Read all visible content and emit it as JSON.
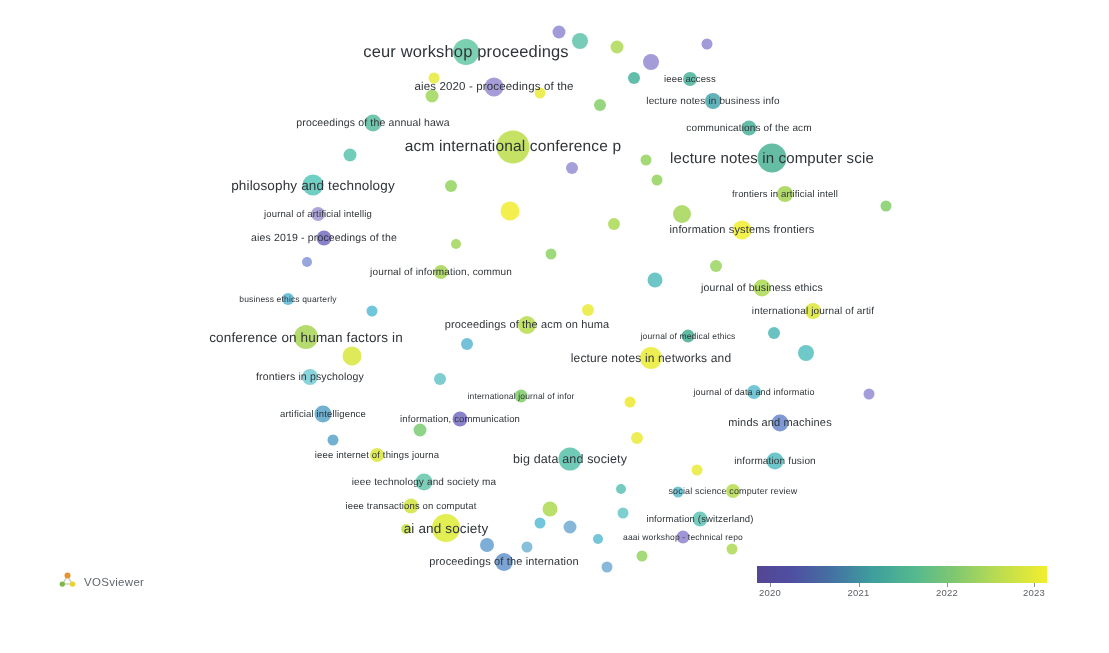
{
  "app": {
    "name": "VOSviewer",
    "brand_label": "VOSviewer",
    "logo_icon": "vosviewer-cluster-logo-icon",
    "background_color": "#ffffff"
  },
  "legend": {
    "title": "",
    "type": "continuous-color-overlay",
    "variable": "average publication year",
    "ticks": [
      {
        "label": "2020",
        "pos_pct": 4.5
      },
      {
        "label": "2021",
        "pos_pct": 35.0
      },
      {
        "label": "2022",
        "pos_pct": 65.5
      },
      {
        "label": "2023",
        "pos_pct": 95.5
      }
    ],
    "gradient_stops": [
      {
        "offset": 0,
        "color": "#4b3d8f"
      },
      {
        "offset": 12,
        "color": "#46469c"
      },
      {
        "offset": 26,
        "color": "#3a6b9e"
      },
      {
        "offset": 40,
        "color": "#349a98"
      },
      {
        "offset": 54,
        "color": "#4bb58a"
      },
      {
        "offset": 68,
        "color": "#79c569"
      },
      {
        "offset": 82,
        "color": "#b3d94a"
      },
      {
        "offset": 100,
        "color": "#f2ee22"
      }
    ]
  },
  "chart_data": {
    "type": "scatter",
    "title": "",
    "xlabel": "",
    "ylabel": "",
    "grid": false,
    "legend_position": "bottom-right",
    "color_scale": {
      "variable": "avg. pub. year",
      "min": 2020,
      "max": 2023,
      "colors": [
        "#4b3d8f",
        "#46469c",
        "#3a6b9e",
        "#349a98",
        "#4bb58a",
        "#79c569",
        "#b3d94a",
        "#f2ee22"
      ]
    },
    "labeled_nodes": [
      {
        "label": "ceur workshop proceedings",
        "x": 466,
        "y": 52,
        "size": 26,
        "font": 16.5,
        "color": "#5cc5a0",
        "year": 2021.5
      },
      {
        "label": "aies 2020 - proceedings of the",
        "x": 494,
        "y": 87,
        "size": 19,
        "font": 11.5,
        "color": "#8f84cf",
        "year": 2020.4
      },
      {
        "label": "ieee access",
        "x": 690,
        "y": 79,
        "size": 14,
        "font": 9.5,
        "color": "#3cad94",
        "year": 2021.2
      },
      {
        "label": "lecture notes in business info",
        "x": 713,
        "y": 101,
        "size": 16,
        "font": 10,
        "color": "#3b9fa8",
        "year": 2021.0
      },
      {
        "label": "proceedings of the annual hawa",
        "x": 373,
        "y": 123,
        "size": 17,
        "font": 10.5,
        "color": "#4fb89a",
        "year": 2021.3
      },
      {
        "label": "communications of the acm",
        "x": 749,
        "y": 128,
        "size": 15,
        "font": 10,
        "color": "#41ad93",
        "year": 2021.2
      },
      {
        "label": "acm international conference p",
        "x": 513,
        "y": 147,
        "size": 33,
        "font": 15.5,
        "color": "#b9dc3f",
        "year": 2022.6
      },
      {
        "label": "lecture notes in computer scie",
        "x": 772,
        "y": 158,
        "size": 29,
        "font": 15,
        "color": "#3fae8d",
        "year": 2021.6
      },
      {
        "label": "philosophy and technology",
        "x": 313,
        "y": 185,
        "size": 21,
        "font": 13.5,
        "color": "#4cc4b4",
        "year": 2021.1
      },
      {
        "label": "frontiers in artificial intell",
        "x": 785,
        "y": 194,
        "size": 16,
        "font": 9.5,
        "color": "#9fd247",
        "year": 2022.3
      },
      {
        "label": "journal of artificial intellig",
        "x": 318,
        "y": 214,
        "size": 14,
        "font": 9.5,
        "color": "#9a8fd0",
        "year": 2020.5
      },
      {
        "label": "information systems frontiers",
        "x": 742,
        "y": 230,
        "size": 19,
        "font": 11,
        "color": "#f2ee22",
        "year": 2022.9
      },
      {
        "label": "aies 2019 - proceedings of the",
        "x": 324,
        "y": 238,
        "size": 15,
        "font": 10.5,
        "color": "#6e63bd",
        "year": 2020.1
      },
      {
        "label": "journal of information, commun",
        "x": 441,
        "y": 272,
        "size": 14,
        "font": 10,
        "color": "#9fd24a",
        "year": 2022.2
      },
      {
        "label": "journal of business ethics",
        "x": 762,
        "y": 288,
        "size": 17,
        "font": 10.5,
        "color": "#a7d648",
        "year": 2022.2
      },
      {
        "label": "business ethics quarterly",
        "x": 288,
        "y": 299,
        "size": 12,
        "font": 8.5,
        "color": "#4fb4d4",
        "year": 2020.9
      },
      {
        "label": "international journal of artif",
        "x": 813,
        "y": 311,
        "size": 16,
        "font": 10,
        "color": "#dbe52c",
        "year": 2022.8
      },
      {
        "label": "proceedings of the acm on huma",
        "x": 527,
        "y": 325,
        "size": 18,
        "font": 11,
        "color": "#b2da42",
        "year": 2022.5
      },
      {
        "label": "conference on human factors in",
        "x": 306,
        "y": 337,
        "size": 24,
        "font": 13.5,
        "color": "#a3d34b",
        "year": 2022.1
      },
      {
        "label": "journal of medical ethics",
        "x": 688,
        "y": 336,
        "size": 13,
        "font": 8.5,
        "color": "#3ba98f",
        "year": 2021.3
      },
      {
        "label": "lecture notes in networks and",
        "x": 651,
        "y": 358,
        "size": 22,
        "font": 12,
        "color": "#e9ea26",
        "year": 2022.9
      },
      {
        "label": "frontiers in psychology",
        "x": 310,
        "y": 377,
        "size": 16,
        "font": 10.5,
        "color": "#6fc9d1",
        "year": 2021.0
      },
      {
        "label": "journal of data and informatio",
        "x": 754,
        "y": 392,
        "size": 14,
        "font": 9,
        "color": "#51b9cc",
        "year": 2021.1
      },
      {
        "label": "international journal of infor",
        "x": 521,
        "y": 396,
        "size": 13,
        "font": 8.5,
        "color": "#77c95f",
        "year": 2021.8
      },
      {
        "label": "artificial intelligence",
        "x": 323,
        "y": 414,
        "size": 17,
        "font": 9.5,
        "color": "#4f9ec4",
        "year": 2020.9
      },
      {
        "label": "information, communication",
        "x": 460,
        "y": 419,
        "size": 15,
        "font": 9.5,
        "color": "#6f63c0",
        "year": 2020.3
      },
      {
        "label": "minds and machines",
        "x": 780,
        "y": 423,
        "size": 17,
        "font": 11,
        "color": "#5f7fc9",
        "year": 2020.7
      },
      {
        "label": "ieee internet of things journa",
        "x": 377,
        "y": 455,
        "size": 14,
        "font": 9.5,
        "color": "#d9e52e",
        "year": 2022.8
      },
      {
        "label": "big data and society",
        "x": 570,
        "y": 459,
        "size": 23,
        "font": 12.5,
        "color": "#4dbfa5",
        "year": 2021.4
      },
      {
        "label": "information fusion",
        "x": 775,
        "y": 461,
        "size": 17,
        "font": 10,
        "color": "#49b8bc",
        "year": 2021.2
      },
      {
        "label": "ieee technology and society ma",
        "x": 424,
        "y": 482,
        "size": 17,
        "font": 10,
        "color": "#5cc3a8",
        "year": 2021.5
      },
      {
        "label": "social science computer review",
        "x": 733,
        "y": 491,
        "size": 14,
        "font": 9,
        "color": "#b2da40",
        "year": 2022.4
      },
      {
        "label": "ieee transactions on computat",
        "x": 411,
        "y": 506,
        "size": 15,
        "font": 9.5,
        "color": "#cfe233",
        "year": 2022.7
      },
      {
        "label": "information (switzerland)",
        "x": 700,
        "y": 519,
        "size": 15,
        "font": 9.5,
        "color": "#55c1b0",
        "year": 2021.3
      },
      {
        "label": "ai and society",
        "x": 446,
        "y": 528,
        "size": 28,
        "font": 13.5,
        "color": "#dcea28",
        "year": 2022.9
      },
      {
        "label": "aaai workshop - technical repo",
        "x": 683,
        "y": 537,
        "size": 13,
        "font": 8.5,
        "color": "#8a7ccb",
        "year": 2020.4
      },
      {
        "label": "proceedings of the internation",
        "x": 504,
        "y": 562,
        "size": 18,
        "font": 11,
        "color": "#5b8ecb",
        "year": 2020.8
      }
    ],
    "unlabeled_nodes": [
      {
        "x": 617,
        "y": 47,
        "size": 13,
        "color": "#a8d84a"
      },
      {
        "x": 580,
        "y": 41,
        "size": 16,
        "color": "#54c0a4"
      },
      {
        "x": 651,
        "y": 62,
        "size": 16,
        "color": "#8d84cf"
      },
      {
        "x": 559,
        "y": 32,
        "size": 13,
        "color": "#8a84d0"
      },
      {
        "x": 540,
        "y": 93,
        "size": 11,
        "color": "#e9ea2c"
      },
      {
        "x": 434,
        "y": 78,
        "size": 11,
        "color": "#e4e92c"
      },
      {
        "x": 600,
        "y": 105,
        "size": 12,
        "color": "#7ecb5e"
      },
      {
        "x": 432,
        "y": 96,
        "size": 13,
        "color": "#98d44f"
      },
      {
        "x": 634,
        "y": 78,
        "size": 12,
        "color": "#3caf95"
      },
      {
        "x": 350,
        "y": 155,
        "size": 13,
        "color": "#4fc0a9"
      },
      {
        "x": 572,
        "y": 168,
        "size": 12,
        "color": "#8f88d2"
      },
      {
        "x": 646,
        "y": 160,
        "size": 11,
        "color": "#8ed055"
      },
      {
        "x": 451,
        "y": 186,
        "size": 12,
        "color": "#8cd154"
      },
      {
        "x": 510,
        "y": 211,
        "size": 19,
        "color": "#f0ec24"
      },
      {
        "x": 614,
        "y": 224,
        "size": 12,
        "color": "#a6d84a"
      },
      {
        "x": 682,
        "y": 214,
        "size": 18,
        "color": "#9fd44c"
      },
      {
        "x": 307,
        "y": 262,
        "size": 10,
        "color": "#7f8fd4"
      },
      {
        "x": 551,
        "y": 254,
        "size": 11,
        "color": "#87d25d"
      },
      {
        "x": 655,
        "y": 280,
        "size": 15,
        "color": "#4bb8b8"
      },
      {
        "x": 716,
        "y": 266,
        "size": 12,
        "color": "#94d455"
      },
      {
        "x": 372,
        "y": 311,
        "size": 11,
        "color": "#4fb8d4"
      },
      {
        "x": 588,
        "y": 310,
        "size": 12,
        "color": "#e9ea2c"
      },
      {
        "x": 467,
        "y": 344,
        "size": 12,
        "color": "#52b4d2"
      },
      {
        "x": 806,
        "y": 353,
        "size": 16,
        "color": "#4cbcbc"
      },
      {
        "x": 352,
        "y": 356,
        "size": 19,
        "color": "#d6e630"
      },
      {
        "x": 440,
        "y": 379,
        "size": 12,
        "color": "#5ec1c4"
      },
      {
        "x": 774,
        "y": 333,
        "size": 12,
        "color": "#47b4b4"
      },
      {
        "x": 420,
        "y": 430,
        "size": 13,
        "color": "#72c96a"
      },
      {
        "x": 630,
        "y": 402,
        "size": 11,
        "color": "#ede824"
      },
      {
        "x": 869,
        "y": 394,
        "size": 11,
        "color": "#8d86d2"
      },
      {
        "x": 637,
        "y": 438,
        "size": 12,
        "color": "#e9e92c"
      },
      {
        "x": 550,
        "y": 509,
        "size": 15,
        "color": "#a7d845"
      },
      {
        "x": 487,
        "y": 545,
        "size": 14,
        "color": "#5d9acf"
      },
      {
        "x": 570,
        "y": 527,
        "size": 13,
        "color": "#68a6cf"
      },
      {
        "x": 540,
        "y": 523,
        "size": 11,
        "color": "#4fb8d4"
      },
      {
        "x": 623,
        "y": 513,
        "size": 11,
        "color": "#5fc4c4"
      },
      {
        "x": 607,
        "y": 567,
        "size": 11,
        "color": "#6ba8d2"
      },
      {
        "x": 678,
        "y": 492,
        "size": 11,
        "color": "#4fb8c9"
      },
      {
        "x": 697,
        "y": 470,
        "size": 11,
        "color": "#e9e92c"
      },
      {
        "x": 642,
        "y": 556,
        "size": 11,
        "color": "#8fd258"
      },
      {
        "x": 527,
        "y": 547,
        "size": 11,
        "color": "#6bb0d2"
      },
      {
        "x": 598,
        "y": 539,
        "size": 10,
        "color": "#4fb8cf"
      },
      {
        "x": 732,
        "y": 549,
        "size": 11,
        "color": "#aad84a"
      },
      {
        "x": 406,
        "y": 529,
        "size": 10,
        "color": "#c3e038"
      },
      {
        "x": 886,
        "y": 206,
        "size": 11,
        "color": "#7dcb60"
      },
      {
        "x": 657,
        "y": 180,
        "size": 11,
        "color": "#8ed055"
      },
      {
        "x": 707,
        "y": 44,
        "size": 11,
        "color": "#8a84d0"
      },
      {
        "x": 333,
        "y": 440,
        "size": 11,
        "color": "#4f9ec4"
      },
      {
        "x": 456,
        "y": 244,
        "size": 10,
        "color": "#9ad450"
      },
      {
        "x": 621,
        "y": 489,
        "size": 10,
        "color": "#53bfb0"
      }
    ]
  }
}
